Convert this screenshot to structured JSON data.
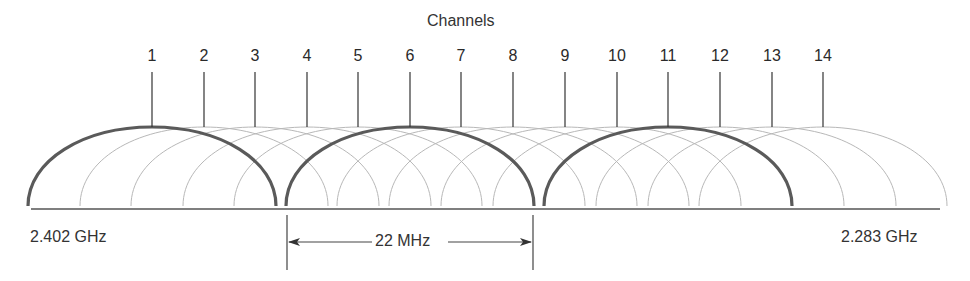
{
  "title": "Channels",
  "channels": [
    {
      "number": "1",
      "x": 152,
      "highlighted": true
    },
    {
      "number": "2",
      "x": 204,
      "highlighted": false
    },
    {
      "number": "3",
      "x": 255,
      "highlighted": false
    },
    {
      "number": "4",
      "x": 307,
      "highlighted": false
    },
    {
      "number": "5",
      "x": 358,
      "highlighted": false
    },
    {
      "number": "6",
      "x": 410,
      "highlighted": true
    },
    {
      "number": "7",
      "x": 461,
      "highlighted": false
    },
    {
      "number": "8",
      "x": 513,
      "highlighted": false
    },
    {
      "number": "9",
      "x": 565,
      "highlighted": false
    },
    {
      "number": "10",
      "x": 617,
      "highlighted": false
    },
    {
      "number": "11",
      "x": 668,
      "highlighted": true
    },
    {
      "number": "12",
      "x": 720,
      "highlighted": false
    },
    {
      "number": "13",
      "x": 772,
      "highlighted": false
    },
    {
      "number": "14",
      "x": 823,
      "highlighted": false
    }
  ],
  "axis": {
    "left_label": "2.402 GHz",
    "right_label": "2.283 GHz"
  },
  "bandwidth": {
    "label": "22 MHz"
  },
  "colors": {
    "highlight_arc": "#5a5a5a",
    "faint_arc": "#b8b8b8",
    "text": "#2a2a2a",
    "baseline": "#555555"
  }
}
